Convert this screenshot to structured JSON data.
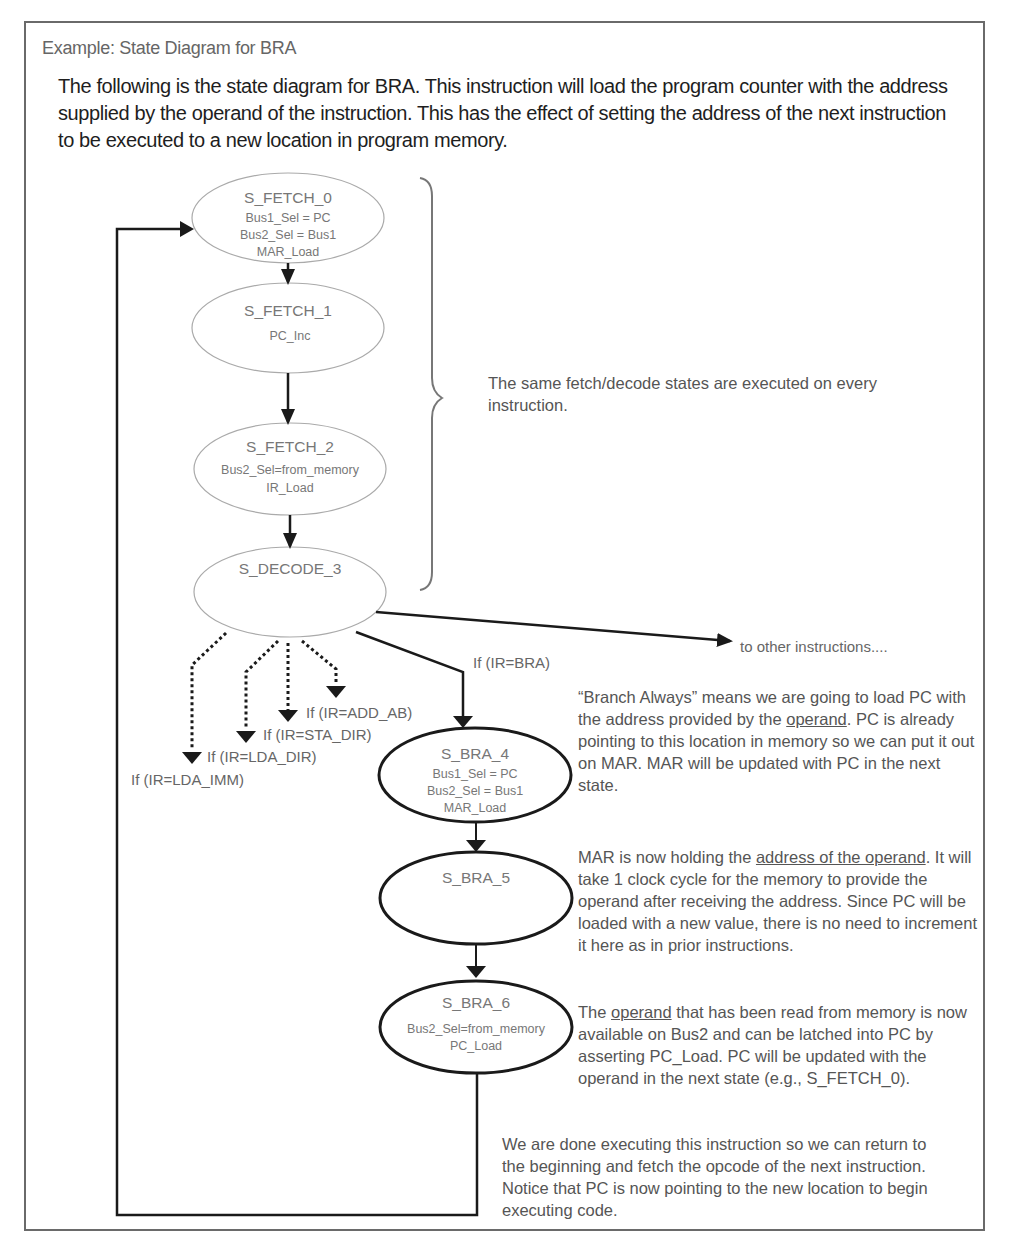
{
  "caption": "Example: State Diagram for BRA",
  "intro": "The following is the state diagram for BRA.  This instruction will load the program counter with the address supplied by the operand of the instruction.  This has the effect of setting the address of the next instruction to be executed to a new location in program memory.",
  "states": [
    {
      "id": "S_FETCH_0",
      "actions": [
        "Bus1_Sel = PC",
        "Bus2_Sel = Bus1",
        "MAR_Load"
      ],
      "bold": false
    },
    {
      "id": "S_FETCH_1",
      "actions": [
        "PC_Inc"
      ],
      "bold": false
    },
    {
      "id": "S_FETCH_2",
      "actions": [
        "Bus2_Sel=from_memory",
        "IR_Load"
      ],
      "bold": false
    },
    {
      "id": "S_DECODE_3",
      "actions": [],
      "bold": false
    },
    {
      "id": "S_BRA_4",
      "actions": [
        "Bus1_Sel = PC",
        "Bus2_Sel = Bus1",
        "MAR_Load"
      ],
      "bold": true
    },
    {
      "id": "S_BRA_5",
      "actions": [],
      "bold": true
    },
    {
      "id": "S_BRA_6",
      "actions": [
        "Bus2_Sel=from_memory",
        "PC_Load"
      ],
      "bold": true
    }
  ],
  "transitions": {
    "decode_branches": [
      {
        "label": "If (IR=LDA_IMM)",
        "style": "dashed"
      },
      {
        "label": "If (IR=LDA_DIR)",
        "style": "dashed"
      },
      {
        "label": "If (IR=STA_DIR)",
        "style": "dashed"
      },
      {
        "label": "If (IR=ADD_AB)",
        "style": "dashed"
      },
      {
        "label": "If (IR=BRA)",
        "style": "solid"
      }
    ],
    "other": "to other instructions...."
  },
  "notes": {
    "fetch_brace": "The same fetch/decode states are executed on every instruction.",
    "bra4": {
      "before": "“Branch Always” means we are going to load PC with the address provided by the ",
      "underlined": "operand",
      "after": ".  PC is already pointing to this location in memory so we can put it out on MAR.  MAR will be updated with PC in the next state."
    },
    "bra5": {
      "before": "MAR is now holding the ",
      "underlined": "address of the operand",
      "after": ".  It will take 1 clock cycle for the memory to provide the operand after receiving the address.  Since PC will be loaded with a new value, there is no need to increment it here as in prior instructions."
    },
    "bra6": {
      "before": "The ",
      "underlined": "operand",
      "after": " that has been read from memory is now available on Bus2 and can be latched into PC by asserting PC_Load. PC will be updated with the operand in the next state (e.g., S_FETCH_0)."
    },
    "return": "We are done executing this instruction so we can return to the beginning and fetch the opcode of the next instruction.  Notice that PC is now pointing to the new location to begin executing code."
  }
}
